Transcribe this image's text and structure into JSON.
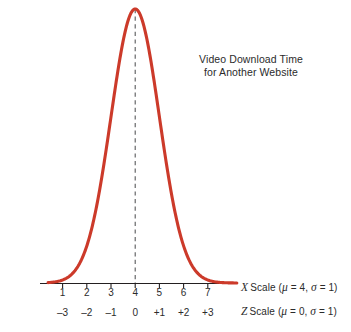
{
  "chart_data": {
    "type": "line",
    "title": "Video Download Time for Another Website",
    "title_lines": [
      "Video Download Time",
      "for Another Website"
    ],
    "distribution": "normal",
    "mu_x": 4,
    "sigma_x": 1,
    "mu_z": 0,
    "sigma_z": 1,
    "curve_color": "#CC3A2A",
    "mean_line_style": "dashed",
    "mean_line_color": "#58595B",
    "mean_line_x_value": 4,
    "axis_color": "#231f20",
    "grid": false,
    "legend": false,
    "xlabel": "X Scale (μ = 4, σ = 1)",
    "x2label": "Z Scale (μ = 0, σ = 1)",
    "ylabel": "",
    "xlim": [
      0.4,
      8.2
    ],
    "ylim": [
      0,
      0.4
    ],
    "x_tick_labels": [
      "1",
      "2",
      "3",
      "4",
      "5",
      "6",
      "7"
    ],
    "x_tick_values": [
      1,
      2,
      3,
      4,
      5,
      6,
      7
    ],
    "z_tick_labels": [
      "–3",
      "–2",
      "–1",
      "0",
      "+1",
      "+2",
      "+3"
    ],
    "z_tick_values": [
      -3,
      -2,
      -1,
      0,
      1,
      2,
      3
    ],
    "x": [
      0.4,
      0.7,
      1.0,
      1.3,
      1.6,
      1.9,
      2.2,
      2.5,
      2.8,
      3.1,
      3.4,
      3.7,
      4.0,
      4.3,
      4.6,
      4.9,
      5.2,
      5.5,
      5.8,
      6.1,
      6.4,
      6.7,
      7.0,
      7.3,
      7.6,
      8.0
    ],
    "y": [
      0.0004,
      0.0017,
      0.0044,
      0.0104,
      0.0224,
      0.044,
      0.079,
      0.1295,
      0.1942,
      0.2661,
      0.3332,
      0.3814,
      0.3989,
      0.3814,
      0.3332,
      0.2661,
      0.1942,
      0.1295,
      0.079,
      0.044,
      0.0224,
      0.0104,
      0.0044,
      0.0017,
      0.0006,
      0.0001
    ]
  },
  "labels": {
    "x_scale_variable": "X",
    "x_scale_word": "Scale",
    "x_scale_params_open": "(",
    "x_scale_mu": "μ",
    "x_scale_mu_eq": " = 4, ",
    "x_scale_sigma": "σ",
    "x_scale_sigma_eq": " = 1)",
    "z_scale_variable": "Z",
    "z_scale_word": "Scale",
    "z_scale_params_open": "(",
    "z_scale_mu": "μ",
    "z_scale_mu_eq": " = 0, ",
    "z_scale_sigma": "σ",
    "z_scale_sigma_eq": " = 1)"
  }
}
